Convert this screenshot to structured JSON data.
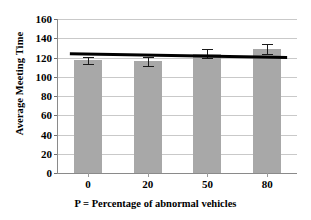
{
  "chart_data": {
    "type": "bar",
    "title": "",
    "xlabel": "P = Percentage of abnormal vehicles",
    "ylabel": "Average Meeting Time",
    "categories": [
      "0",
      "20",
      "50",
      "80"
    ],
    "values": [
      117,
      116,
      124,
      129
    ],
    "errors": [
      4,
      5,
      5,
      5
    ],
    "yticks": [
      0,
      20,
      40,
      60,
      80,
      100,
      120,
      140,
      160
    ],
    "ytick_labels": [
      "0",
      "20",
      "40",
      "60",
      "80",
      "100",
      "120",
      "140",
      "160"
    ],
    "ylim": [
      0,
      160
    ],
    "grid": true,
    "legend": "none",
    "series": [
      {
        "name": "Average Meeting Time",
        "type": "bar",
        "values": [
          117,
          116,
          124,
          129
        ],
        "color": "#a8a8a8"
      },
      {
        "name": "Trend line",
        "type": "line",
        "values": [
          124,
          122.7,
          121.3,
          120
        ],
        "color": "#000000"
      }
    ],
    "trendline": {
      "start_value": 124,
      "end_value": 120,
      "color": "#000000"
    },
    "colors": {
      "bar": "#a8a8a8",
      "trendline": "#000000",
      "gridline": "#c9c9c9",
      "axis": "#8a8a8a",
      "text": "#000000",
      "background": "#ffffff"
    }
  }
}
